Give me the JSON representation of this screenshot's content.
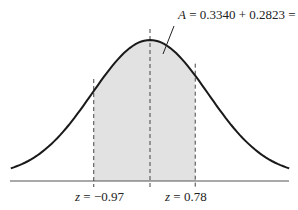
{
  "chart_data": {
    "type": "area",
    "title": "",
    "annotation": {
      "var": "A",
      "text": " = 0.3340 + 0.2823 = 0.6163",
      "left_area": 0.334,
      "right_area": 0.2823,
      "total_area": 0.6163
    },
    "z_lower": -0.97,
    "z_upper": 0.78,
    "mean": 0,
    "labels": {
      "lower": {
        "var": "z",
        "text": " = −0.97"
      },
      "upper": {
        "var": "z",
        "text": " = 0.78"
      }
    },
    "colors": {
      "curve": "#1a1a1a",
      "shade": "#e2e2e2",
      "axis": "#555555",
      "dash": "#444444"
    },
    "xlim": [
      -3.2,
      3.2
    ],
    "grid": false,
    "legend": null
  }
}
